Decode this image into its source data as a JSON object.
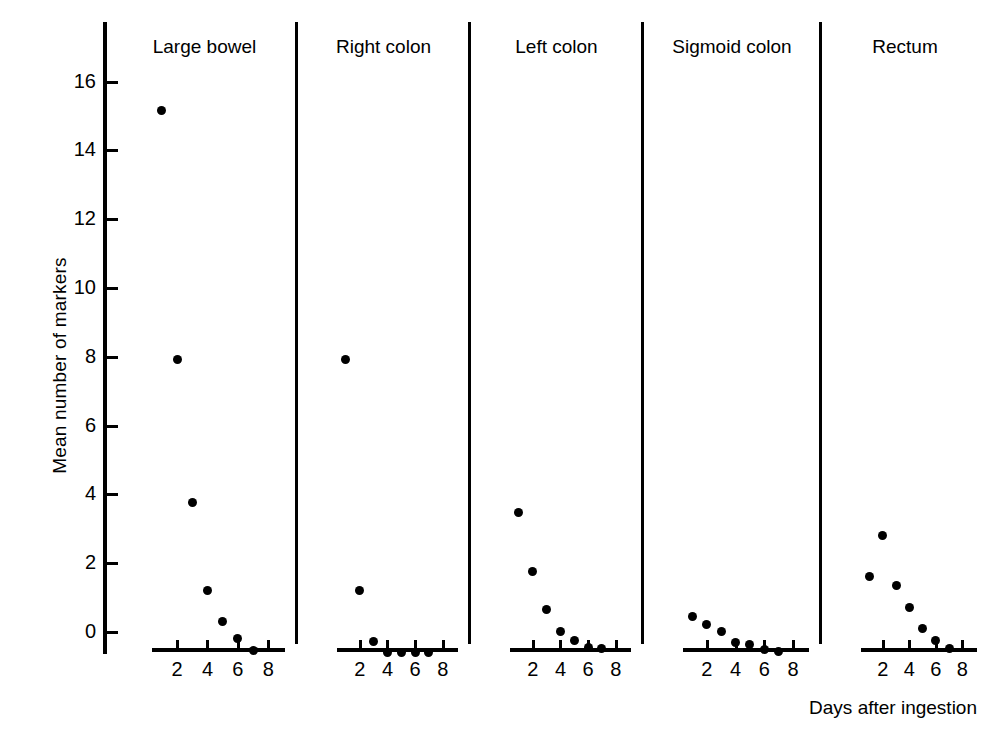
{
  "chart_data": {
    "type": "scatter",
    "title": "",
    "xlabel": "Days after ingestion",
    "ylabel": "Mean number of markers",
    "ylim": [
      0,
      17
    ],
    "xlim": [
      0,
      9.2
    ],
    "yticks": [
      0,
      2,
      4,
      6,
      8,
      10,
      12,
      14,
      16
    ],
    "ytick_labels": [
      "0",
      "2",
      "4",
      "6",
      "8",
      "10",
      "12",
      "14",
      "16"
    ],
    "xticks": [
      2,
      4,
      6,
      8
    ],
    "xtick_labels": [
      "2",
      "4",
      "6",
      "8"
    ],
    "grid": false,
    "legend": "none",
    "marker_color": "#000000",
    "panels": [
      {
        "label": "Large bowel",
        "x": [
          1,
          2,
          3,
          4,
          5,
          6,
          7
        ],
        "y": [
          15.8,
          8.55,
          4.4,
          1.85,
          0.95,
          0.45,
          0.1
        ]
      },
      {
        "label": "Right colon",
        "x": [
          1,
          2,
          3,
          4,
          5,
          6,
          7
        ],
        "y": [
          8.55,
          1.85,
          0.35,
          0.05,
          0.05,
          0.05,
          0.05
        ]
      },
      {
        "label": "Left colon",
        "x": [
          1,
          2,
          3,
          4,
          5,
          6,
          7
        ],
        "y": [
          4.1,
          2.4,
          1.3,
          0.65,
          0.4,
          0.2,
          0.15
        ]
      },
      {
        "label": "Sigmoid colon",
        "x": [
          1,
          2,
          3,
          4,
          5,
          6,
          7
        ],
        "y": [
          1.1,
          0.85,
          0.65,
          0.32,
          0.28,
          0.12,
          0.08
        ]
      },
      {
        "label": "Rectum",
        "x": [
          1,
          2,
          3,
          4,
          5,
          6,
          7
        ],
        "y": [
          2.25,
          3.45,
          2.0,
          1.35,
          0.75,
          0.4,
          0.15
        ]
      }
    ]
  },
  "axes": {
    "y_title": "Mean number of markers",
    "x_title": "Days after ingestion"
  }
}
